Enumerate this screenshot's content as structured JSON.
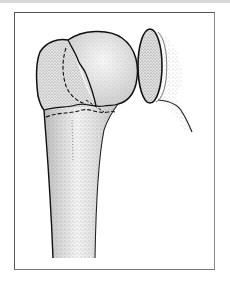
{
  "figure": {
    "elements": [
      {
        "name": "humeral-head",
        "shape": "rounded dome"
      },
      {
        "name": "greater-tuberosity-fragment",
        "shape": "stippled lobe left of head"
      },
      {
        "name": "glenoid",
        "shape": "oval disc at right"
      },
      {
        "name": "humeral-shaft",
        "shape": "tapering stippled shaft"
      },
      {
        "name": "fracture-lines",
        "style": "solid and dashed lines across neck"
      }
    ],
    "colors": {
      "frame_border": "#555555",
      "ink": "#1a1a1a",
      "stipple": "#6a6a6a",
      "bone_fill": "#e9e9e9",
      "top_band": "#d8d8d8"
    }
  }
}
